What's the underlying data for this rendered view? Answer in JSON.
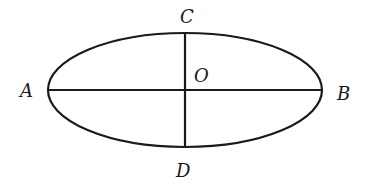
{
  "diagram": {
    "type": "ellipse-with-axes",
    "stroke_color": "#1a1a1a",
    "background": "#ffffff",
    "ellipse": {
      "cx": 185,
      "cy": 90,
      "rx": 137,
      "ry": 57
    },
    "major_axis": {
      "from": "A",
      "to": "B"
    },
    "minor_axis": {
      "from": "C",
      "to": "D"
    },
    "labels": {
      "A": "A",
      "B": "B",
      "C": "C",
      "D": "D",
      "O": "O"
    }
  }
}
